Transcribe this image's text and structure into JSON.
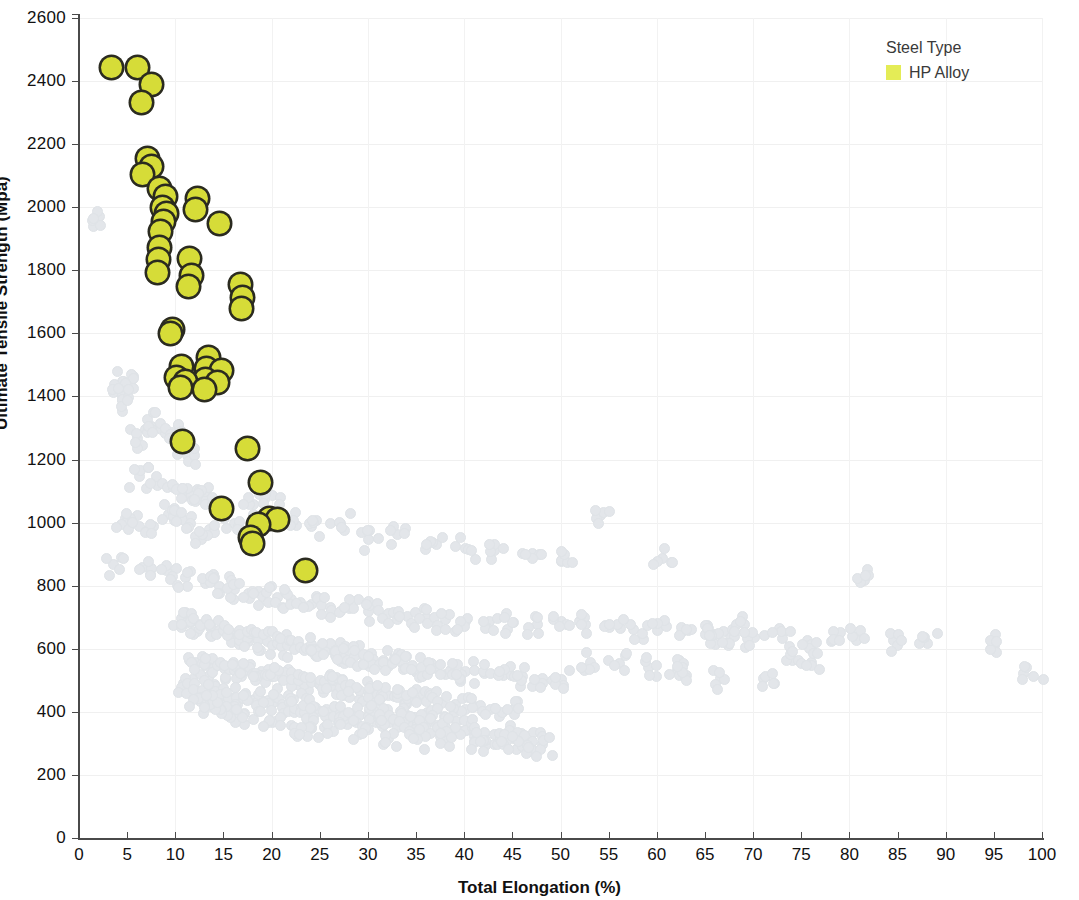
{
  "chart_data": {
    "type": "scatter",
    "title": "",
    "xlabel": "Total Elongation (%)",
    "ylabel": "Ultimate Tensile Strength (Mpa)",
    "xlim": [
      0,
      100
    ],
    "ylim": [
      0,
      2600
    ],
    "xticks": [
      0,
      5,
      10,
      15,
      20,
      25,
      30,
      35,
      40,
      45,
      50,
      55,
      60,
      65,
      70,
      75,
      80,
      85,
      90,
      95,
      100
    ],
    "yticks": [
      0,
      200,
      400,
      600,
      800,
      1000,
      1200,
      1400,
      1600,
      1800,
      2000,
      2200,
      2400,
      2600
    ],
    "grid": true,
    "legend": {
      "title": "Steel Type",
      "position": "top-right",
      "entries": [
        {
          "label": "HP Alloy",
          "color": "#e4ec56"
        }
      ]
    },
    "series": [
      {
        "name": "HP Alloy",
        "color": "#d6dc38",
        "marker": "circle-outlined",
        "points": [
          [
            3.2,
            2450
          ],
          [
            5.9,
            2450
          ],
          [
            7.3,
            2395
          ],
          [
            6.3,
            2340
          ],
          [
            6.9,
            2160
          ],
          [
            7.3,
            2135
          ],
          [
            6.4,
            2110
          ],
          [
            8.2,
            2065
          ],
          [
            8.8,
            2040
          ],
          [
            12.1,
            2035
          ],
          [
            11.9,
            2000
          ],
          [
            8.5,
            2005
          ],
          [
            8.9,
            1985
          ],
          [
            8.6,
            1960
          ],
          [
            14.4,
            1955
          ],
          [
            8.3,
            1930
          ],
          [
            8.1,
            1880
          ],
          [
            11.3,
            1845
          ],
          [
            8.0,
            1840
          ],
          [
            7.9,
            1800
          ],
          [
            11.5,
            1790
          ],
          [
            16.6,
            1760
          ],
          [
            11.2,
            1755
          ],
          [
            16.8,
            1720
          ],
          [
            16.7,
            1685
          ],
          [
            9.5,
            1620
          ],
          [
            9.3,
            1605
          ],
          [
            13.2,
            1530
          ],
          [
            10.4,
            1500
          ],
          [
            13.0,
            1495
          ],
          [
            14.6,
            1490
          ],
          [
            9.9,
            1465
          ],
          [
            12.9,
            1460
          ],
          [
            10.9,
            1455
          ],
          [
            14.2,
            1450
          ],
          [
            10.3,
            1435
          ],
          [
            12.8,
            1430
          ],
          [
            10.5,
            1265
          ],
          [
            17.3,
            1240
          ],
          [
            18.6,
            1135
          ],
          [
            14.6,
            1050
          ],
          [
            19.6,
            1020
          ],
          [
            20.4,
            1015
          ],
          [
            18.4,
            1000
          ],
          [
            17.6,
            960
          ],
          [
            17.8,
            940
          ],
          [
            23.3,
            855
          ]
        ]
      },
      {
        "name": "Background (other steels)",
        "color": "#e3e6ea",
        "marker": "circle",
        "note": "large light-gray background cloud, decreasing strength with increasing elongation",
        "points": [
          [
            2.0,
            1975
          ],
          [
            4.5,
            1450
          ],
          [
            4.0,
            1420
          ],
          [
            4.4,
            1390
          ],
          [
            5.0,
            1400
          ],
          [
            7.0,
            1330
          ],
          [
            7.4,
            1300
          ],
          [
            6.0,
            1270
          ],
          [
            9.5,
            1290
          ],
          [
            10.2,
            1260
          ],
          [
            11.2,
            1215
          ],
          [
            6.2,
            1150
          ],
          [
            8.0,
            1120
          ],
          [
            10.0,
            1110
          ],
          [
            11.6,
            1090
          ],
          [
            12.4,
            1105
          ],
          [
            13.0,
            1060
          ],
          [
            9.2,
            1030
          ],
          [
            10.8,
            1010
          ],
          [
            5.5,
            1000
          ],
          [
            4.6,
            1000
          ],
          [
            7.6,
            990
          ],
          [
            13.4,
            980
          ],
          [
            12.0,
            960
          ],
          [
            16.0,
            1000
          ],
          [
            18.0,
            1060
          ],
          [
            20.0,
            1090
          ],
          [
            22.0,
            1010
          ],
          [
            24.0,
            990
          ],
          [
            27.0,
            1000
          ],
          [
            30.0,
            950
          ],
          [
            33.0,
            965
          ],
          [
            37.0,
            935
          ],
          [
            40.0,
            920
          ],
          [
            43.0,
            915
          ],
          [
            47.0,
            905
          ],
          [
            50.0,
            880
          ],
          [
            54.0,
            1025
          ],
          [
            60.5,
            890
          ],
          [
            81.5,
            820
          ],
          [
            3.5,
            870
          ],
          [
            6.5,
            860
          ],
          [
            9.0,
            850
          ],
          [
            11.0,
            830
          ],
          [
            13.0,
            810
          ],
          [
            14.5,
            800
          ],
          [
            16.0,
            790
          ],
          [
            17.5,
            780
          ],
          [
            19.0,
            770
          ],
          [
            20.5,
            765
          ],
          [
            22.0,
            760
          ],
          [
            24.0,
            745
          ],
          [
            26.0,
            735
          ],
          [
            28.0,
            730
          ],
          [
            30.0,
            720
          ],
          [
            32.0,
            715
          ],
          [
            34.0,
            705
          ],
          [
            36.0,
            700
          ],
          [
            38.0,
            695
          ],
          [
            40.0,
            690
          ],
          [
            42.5,
            690
          ],
          [
            45.0,
            685
          ],
          [
            47.5,
            680
          ],
          [
            50.0,
            690
          ],
          [
            52.5,
            680
          ],
          [
            55.0,
            670
          ],
          [
            57.5,
            665
          ],
          [
            60.0,
            660
          ],
          [
            62.5,
            655
          ],
          [
            65.0,
            650
          ],
          [
            67.5,
            645
          ],
          [
            70.0,
            640
          ],
          [
            73.0,
            635
          ],
          [
            75.5,
            630
          ],
          [
            78.0,
            625
          ],
          [
            81.0,
            640
          ],
          [
            84.5,
            630
          ],
          [
            88.0,
            620
          ],
          [
            95.0,
            615
          ],
          [
            99.0,
            515
          ],
          [
            10.5,
            700
          ],
          [
            11.5,
            690
          ],
          [
            12.5,
            680
          ],
          [
            13.5,
            670
          ],
          [
            14.5,
            660
          ],
          [
            15.5,
            650
          ],
          [
            16.5,
            645
          ],
          [
            17.5,
            640
          ],
          [
            18.5,
            630
          ],
          [
            19.5,
            625
          ],
          [
            20.5,
            620
          ],
          [
            21.5,
            615
          ],
          [
            22.5,
            610
          ],
          [
            23.5,
            605
          ],
          [
            24.5,
            600
          ],
          [
            25.5,
            595
          ],
          [
            26.5,
            590
          ],
          [
            27.5,
            585
          ],
          [
            28.5,
            580
          ],
          [
            29.5,
            575
          ],
          [
            30.5,
            570
          ],
          [
            31.5,
            565
          ],
          [
            32.5,
            560
          ],
          [
            33.5,
            555
          ],
          [
            34.5,
            550
          ],
          [
            35.5,
            545
          ],
          [
            37.0,
            540
          ],
          [
            38.5,
            535
          ],
          [
            40.0,
            530
          ],
          [
            42.0,
            525
          ],
          [
            44.0,
            520
          ],
          [
            46.0,
            515
          ],
          [
            48.0,
            510
          ],
          [
            50.0,
            505
          ],
          [
            53.0,
            560
          ],
          [
            56.0,
            555
          ],
          [
            59.0,
            545
          ],
          [
            62.0,
            535
          ],
          [
            66.0,
            650
          ],
          [
            69.0,
            680
          ],
          [
            12.0,
            560
          ],
          [
            13.0,
            550
          ],
          [
            14.0,
            545
          ],
          [
            15.0,
            540
          ],
          [
            16.0,
            535
          ],
          [
            17.0,
            530
          ],
          [
            18.0,
            525
          ],
          [
            19.0,
            520
          ],
          [
            20.0,
            515
          ],
          [
            21.0,
            510
          ],
          [
            22.0,
            505
          ],
          [
            23.0,
            500
          ],
          [
            24.0,
            495
          ],
          [
            25.0,
            490
          ],
          [
            26.0,
            485
          ],
          [
            27.0,
            480
          ],
          [
            28.0,
            475
          ],
          [
            29.0,
            470
          ],
          [
            30.0,
            465
          ],
          [
            31.0,
            460
          ],
          [
            32.0,
            455
          ],
          [
            33.0,
            450
          ],
          [
            34.0,
            445
          ],
          [
            35.0,
            440
          ],
          [
            36.0,
            435
          ],
          [
            37.5,
            430
          ],
          [
            39.0,
            425
          ],
          [
            41.0,
            420
          ],
          [
            43.0,
            415
          ],
          [
            45.0,
            410
          ],
          [
            11.0,
            480
          ],
          [
            12.0,
            470
          ],
          [
            13.0,
            465
          ],
          [
            14.0,
            460
          ],
          [
            15.0,
            455
          ],
          [
            16.0,
            450
          ],
          [
            17.0,
            445
          ],
          [
            18.0,
            440
          ],
          [
            19.0,
            435
          ],
          [
            20.0,
            430
          ],
          [
            21.0,
            425
          ],
          [
            22.0,
            420
          ],
          [
            23.0,
            415
          ],
          [
            24.0,
            410
          ],
          [
            25.0,
            405
          ],
          [
            26.0,
            400
          ],
          [
            27.0,
            398
          ],
          [
            28.0,
            395
          ],
          [
            29.0,
            392
          ],
          [
            30.0,
            390
          ],
          [
            31.0,
            385
          ],
          [
            32.0,
            382
          ],
          [
            33.0,
            378
          ],
          [
            34.0,
            375
          ],
          [
            35.0,
            370
          ],
          [
            36.0,
            365
          ],
          [
            37.0,
            360
          ],
          [
            38.0,
            355
          ],
          [
            39.0,
            350
          ],
          [
            40.0,
            345
          ],
          [
            41.0,
            340
          ],
          [
            42.0,
            335
          ],
          [
            43.0,
            330
          ],
          [
            44.0,
            325
          ],
          [
            45.0,
            320
          ],
          [
            46.0,
            315
          ],
          [
            47.0,
            310
          ],
          [
            48.0,
            300
          ],
          [
            46.5,
            295
          ],
          [
            44.0,
            300
          ],
          [
            41.0,
            305
          ],
          [
            38.0,
            310
          ],
          [
            35.0,
            315
          ],
          [
            32.0,
            320
          ],
          [
            29.0,
            330
          ],
          [
            26.0,
            340
          ],
          [
            24.0,
            350
          ],
          [
            22.0,
            360
          ],
          [
            20.0,
            370
          ],
          [
            18.0,
            380
          ],
          [
            16.5,
            395
          ],
          [
            15.5,
            405
          ],
          [
            14.5,
            415
          ],
          [
            13.5,
            425
          ],
          [
            12.5,
            435
          ],
          [
            63.0,
            520
          ],
          [
            66.5,
            510
          ],
          [
            71.0,
            510
          ],
          [
            74.0,
            565
          ],
          [
            76.0,
            560
          ]
        ]
      }
    ]
  },
  "legend": {
    "title": "Steel Type",
    "entry_label": "HP Alloy"
  },
  "axes": {
    "x_title": "Total Elongation (%)",
    "y_title": "Ultimate Tensile Strength (Mpa)"
  }
}
